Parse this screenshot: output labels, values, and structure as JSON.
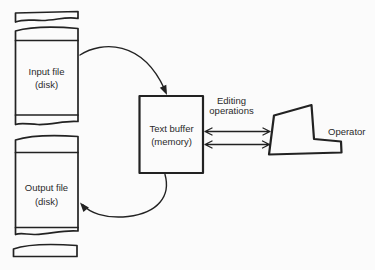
{
  "colors": {
    "background": "#fbfbfb",
    "ink": "#222222",
    "text": "#2a2a2a"
  },
  "diagram": {
    "input_file": {
      "line1": "Input file",
      "line2": "(disk)"
    },
    "output_file": {
      "line1": "Output file",
      "line2": "(disk)"
    },
    "text_buffer": {
      "line1": "Text buffer",
      "line2": "(memory)"
    },
    "editing_operations": {
      "line1": "Editing",
      "line2": "operations"
    },
    "operator": {
      "label": "Operator"
    }
  }
}
